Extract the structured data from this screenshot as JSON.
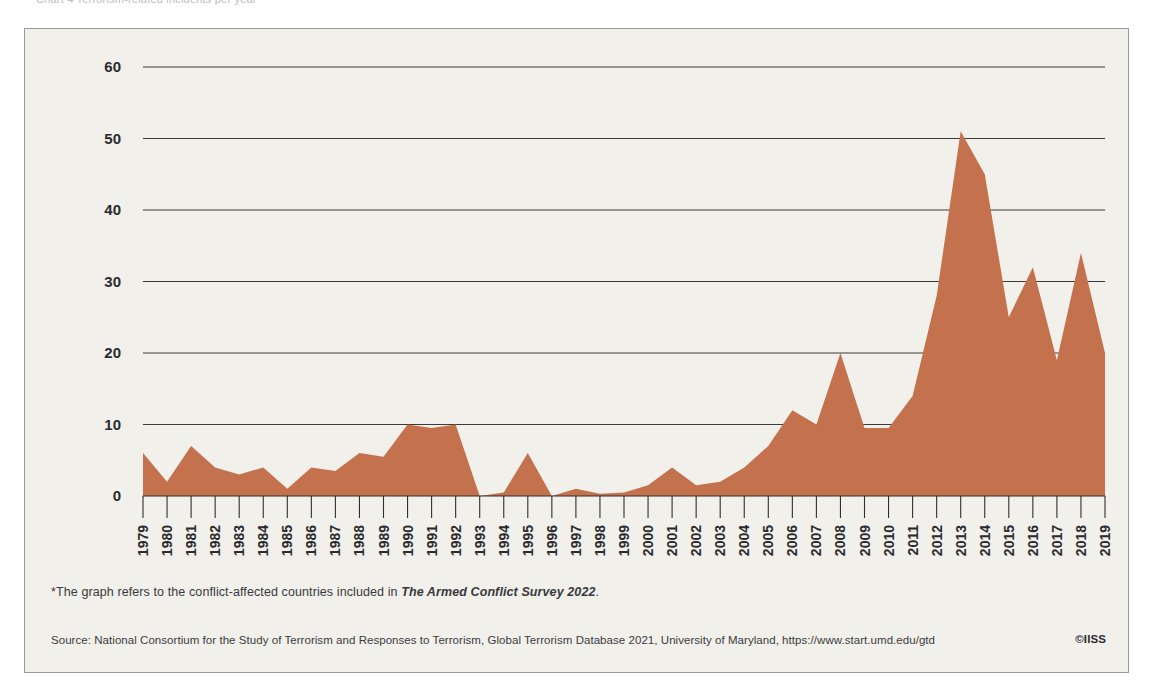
{
  "topstrip": {
    "cut_text": "Chart 4  Terrorism-related incidents per year*"
  },
  "panel": {
    "background_color": "#f1f0eb",
    "border_color": "#9a9a9a"
  },
  "footnote": {
    "prefix": "*The graph refers to the conflict-affected countries included in ",
    "italic": "The Armed Conflict Survey 2022",
    "suffix": "."
  },
  "source": {
    "text": "Source: National Consortium for the Study of Terrorism and Responses to Terrorism, Global Terrorism Database 2021, University of Maryland, https://www.start.umd.edu/gtd",
    "credit": "©IISS"
  },
  "chart_data": {
    "type": "area",
    "title": "",
    "xlabel": "",
    "ylabel": "",
    "series_color": "#c4714e",
    "grid": true,
    "legend": "none",
    "ylim": [
      0,
      60
    ],
    "yticks": [
      0,
      10,
      20,
      30,
      40,
      50,
      60
    ],
    "categories": [
      "1979",
      "1980",
      "1981",
      "1982",
      "1983",
      "1984",
      "1985",
      "1986",
      "1987",
      "1988",
      "1989",
      "1990",
      "1991",
      "1992",
      "1993",
      "1994",
      "1995",
      "1996",
      "1997",
      "1998",
      "1999",
      "2000",
      "2001",
      "2002",
      "2003",
      "2004",
      "2005",
      "2006",
      "2007",
      "2008",
      "2009",
      "2010",
      "2011",
      "2012",
      "2013",
      "2014",
      "2015",
      "2016",
      "2017",
      "2018",
      "2019"
    ],
    "values": [
      6,
      2,
      7,
      4,
      3,
      4,
      1,
      4,
      3.5,
      6,
      5.5,
      10,
      9.5,
      10,
      0,
      0.5,
      6,
      0,
      1,
      0.3,
      0.5,
      1.5,
      4,
      1.5,
      2,
      4,
      7,
      12,
      10,
      20,
      9.5,
      9.5,
      14,
      28,
      51,
      45,
      25,
      32,
      19,
      34,
      20
    ]
  }
}
